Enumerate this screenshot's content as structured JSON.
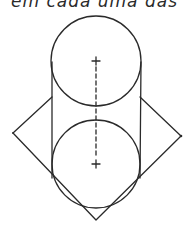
{
  "caption": {
    "text": "em cada uma das"
  },
  "figure": {
    "stroke_color": "#2a2a2a",
    "top_circle": {
      "cx": 96,
      "cy": 61,
      "r": 45
    },
    "bottom_circle": {
      "cx": 96,
      "cy": 164,
      "r": 44
    },
    "cylinder_left_x": 52,
    "cylinder_right_x": 141,
    "cylinder_top_y": 62,
    "cylinder_bottom_y": 178,
    "axis": {
      "x": 96,
      "y1": 62,
      "y2": 164
    },
    "rhombus": {
      "left": [
        13,
        133
      ],
      "right": [
        181,
        136
      ],
      "bottom": [
        96,
        220
      ],
      "top_left_end": [
        52,
        97
      ],
      "top_right_end": [
        140,
        97
      ]
    },
    "markers": [
      {
        "name": "top-center-cross",
        "x": 96,
        "y": 61
      },
      {
        "name": "bottom-center-cross",
        "x": 96,
        "y": 164
      }
    ]
  }
}
